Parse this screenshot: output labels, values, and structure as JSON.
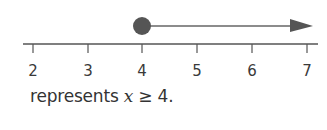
{
  "number_line": {
    "ticks": [
      {
        "value": "2",
        "x": 33
      },
      {
        "value": "3",
        "x": 88
      },
      {
        "value": "4",
        "x": 142
      },
      {
        "value": "5",
        "x": 197
      },
      {
        "value": "6",
        "x": 252
      },
      {
        "value": "7",
        "x": 307
      }
    ],
    "closed_point_at": 4,
    "ray_direction": "right",
    "colors": {
      "line": "#555555",
      "point": "#555555",
      "arrow": "#555555"
    }
  },
  "caption": {
    "prefix": "represents ",
    "variable": "x",
    "relation": " ≥ 4."
  }
}
